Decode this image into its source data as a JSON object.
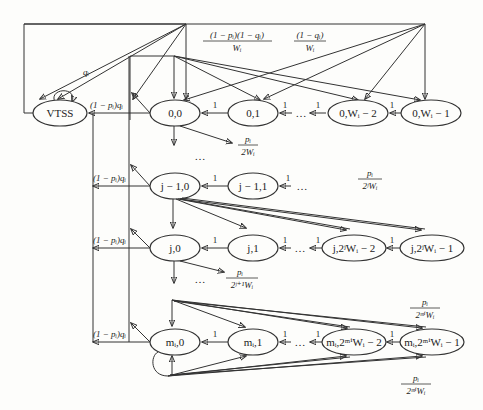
{
  "diagram": {
    "nodes": {
      "vtss": "VTSS",
      "s00": "0,0",
      "s01": "0,1",
      "s0w2": "0,Wᵢ − 2",
      "s0w1": "0,Wᵢ − 1",
      "sj10": "j − 1,0",
      "sj11": "j − 1,1",
      "sj0": "j,0",
      "sj1": "j,1",
      "sjw2": "j,2ʲWᵢ − 2",
      "sjw1": "j,2ʲWᵢ − 1",
      "sm0": "mᵢ,0",
      "sm1": "mᵢ,1",
      "smw2": "mᵢ,2ᵐⁱWᵢ − 2",
      "smw1": "mᵢ,2ᵐⁱWᵢ − 1"
    },
    "edge_labels": {
      "self_loop_vtss": "qᵢ",
      "to_vtss": "(1 − pᵢ)qᵢ",
      "top_left_num": "(1 − pᵢ)(1 − qᵢ)",
      "top_left_den": "Wᵢ",
      "top_right_num": "(1 − qᵢ)",
      "top_right_den": "Wᵢ",
      "stage1_num": "pᵢ",
      "stage1_den": "2Wᵢ",
      "stagej_num": "pᵢ",
      "stagej_den": "2ʲWᵢ",
      "stagej1_num": "pᵢ",
      "stagej1_den": "2ʲ⁺¹Wᵢ",
      "stagem_num": "pᵢ",
      "stagem_den": "2ᵐⁱWᵢ",
      "stagem_bottom_num": "pᵢ",
      "stagem_bottom_den": "2ᵐⁱWᵢ",
      "decrement": "1",
      "ellipsis": "…"
    },
    "colors": {
      "stroke": "#333333",
      "background": "#fdfdfb"
    }
  }
}
